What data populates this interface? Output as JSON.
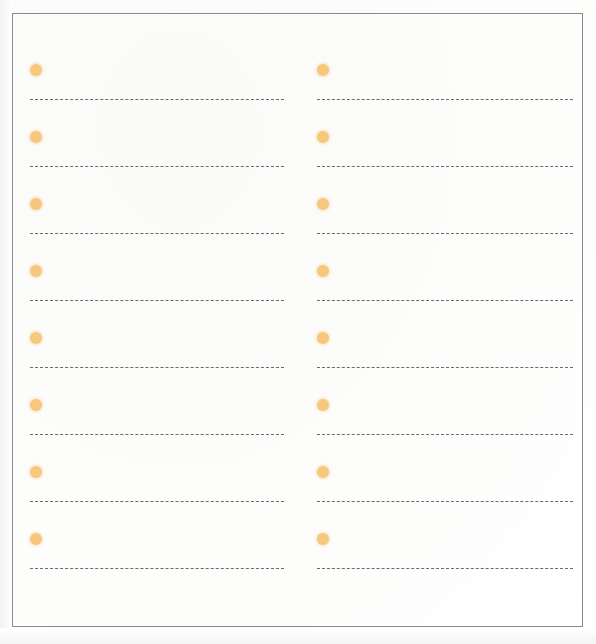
{
  "document": {
    "kind": "scanned-worksheet-page",
    "background_color": "#fefefe",
    "border_color": "#8b8b8f",
    "bullet_color": "#f6c77c",
    "line_color": "#5d5d63",
    "line_style": "dashed",
    "columns_count": 2,
    "rows_per_column": 8
  },
  "columns": [
    {
      "name": "left-column",
      "rows": [
        {
          "bullet": "●",
          "line_text": "",
          "line_placeholder": ""
        },
        {
          "bullet": "●",
          "line_text": "",
          "line_placeholder": ""
        },
        {
          "bullet": "●",
          "line_text": "",
          "line_placeholder": ""
        },
        {
          "bullet": "●",
          "line_text": "",
          "line_placeholder": ""
        },
        {
          "bullet": "●",
          "line_text": "",
          "line_placeholder": ""
        },
        {
          "bullet": "●",
          "line_text": "",
          "line_placeholder": ""
        },
        {
          "bullet": "●",
          "line_text": "",
          "line_placeholder": ""
        },
        {
          "bullet": "●",
          "line_text": "",
          "line_placeholder": ""
        }
      ]
    },
    {
      "name": "right-column",
      "rows": [
        {
          "bullet": "●",
          "line_text": "",
          "line_placeholder": ""
        },
        {
          "bullet": "●",
          "line_text": "",
          "line_placeholder": ""
        },
        {
          "bullet": "●",
          "line_text": "",
          "line_placeholder": ""
        },
        {
          "bullet": "●",
          "line_text": "",
          "line_placeholder": ""
        },
        {
          "bullet": "●",
          "line_text": "",
          "line_placeholder": ""
        },
        {
          "bullet": "●",
          "line_text": "",
          "line_placeholder": ""
        },
        {
          "bullet": "●",
          "line_text": "",
          "line_placeholder": ""
        },
        {
          "bullet": "●",
          "line_text": "",
          "line_placeholder": ""
        }
      ]
    }
  ]
}
